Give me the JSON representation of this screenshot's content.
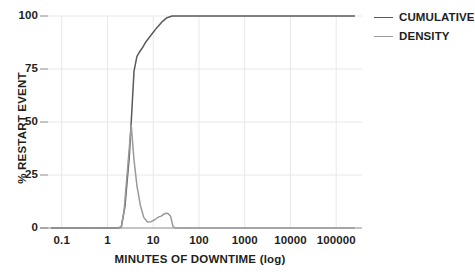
{
  "chart_data": {
    "type": "line",
    "title": "",
    "xlabel": "MINUTES OF DOWNTIME (log)",
    "ylabel": "% RESTART EVENT",
    "xscale": "log",
    "xlim": [
      0.05,
      300000
    ],
    "ylim": [
      0,
      100
    ],
    "xticks": [
      0.1,
      1,
      10,
      100,
      1000,
      10000,
      100000
    ],
    "xticklabels": [
      "0.1",
      "1",
      "10",
      "100",
      "1000",
      "10000",
      "100000"
    ],
    "yticks": [
      0,
      25,
      50,
      75,
      100
    ],
    "yticklabels": [
      "0",
      "25",
      "50",
      "75",
      "100"
    ],
    "grid": "both-light",
    "legend_position": "right",
    "series": [
      {
        "name": "CUMULATIVE",
        "color": "#5a5a5a",
        "x": [
          0.06,
          0.1,
          0.5,
          1,
          1.6,
          2,
          2.4,
          3,
          3.4,
          3.8,
          4.4,
          5,
          6,
          7,
          9,
          12,
          16,
          20,
          26,
          35,
          60,
          100,
          1000,
          10000,
          100000,
          250000
        ],
        "y": [
          0,
          0,
          0,
          0,
          0,
          0.4,
          10,
          34,
          55,
          74,
          81,
          83,
          85.5,
          88,
          91,
          94.5,
          97.5,
          99.2,
          100,
          100,
          100,
          100,
          100,
          100,
          100,
          100
        ]
      },
      {
        "name": "DENSITY",
        "color": "#9a9a9a",
        "x": [
          0.06,
          0.1,
          0.5,
          1,
          1.6,
          2,
          2.3,
          2.8,
          3.3,
          3.8,
          4.4,
          5.2,
          6.2,
          7.5,
          9,
          11,
          13,
          15,
          17,
          19,
          21,
          24,
          27,
          30,
          40,
          100,
          1000,
          10000,
          100000,
          250000
        ],
        "y": [
          0,
          0,
          0,
          0,
          0,
          0.4,
          8,
          30,
          48.5,
          32,
          20,
          11,
          5,
          2.8,
          3,
          4,
          5.2,
          5.6,
          6.5,
          7,
          6.8,
          5.5,
          0.8,
          0,
          0,
          0,
          0,
          0,
          0,
          0
        ]
      }
    ]
  },
  "legend": {
    "items": [
      {
        "label": "CUMULATIVE",
        "color": "#5a5a5a"
      },
      {
        "label": "DENSITY",
        "color": "#9a9a9a"
      }
    ]
  },
  "axes": {
    "y_tick_labels": [
      "100",
      "75",
      "50",
      "25",
      "0"
    ],
    "x_tick_labels": [
      "0.1",
      "1",
      "10",
      "100",
      "1000",
      "10000",
      "100000"
    ],
    "x_title": "MINUTES OF DOWNTIME (log)",
    "y_title": "% RESTART EVENT"
  },
  "colors": {
    "background": "#ffffff",
    "grid": "#e8e8e8",
    "axis": "#8a8a8a",
    "text": "#231f20",
    "cumulative": "#5a5a5a",
    "density": "#9a9a9a"
  }
}
